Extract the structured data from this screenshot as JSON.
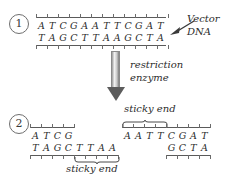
{
  "diagram": {
    "background_color": "#ffffff",
    "ink_color": "#2b2b2b"
  },
  "steps": [
    {
      "number": "1"
    },
    {
      "number": "2"
    }
  ],
  "labels": {
    "vector_dna_line1": "Vector",
    "vector_dna_line2": "DNA",
    "restriction_line1": "restriction",
    "restriction_line2": "enzyme",
    "sticky_end_right": "sticky end",
    "sticky_end_left": "sticky end"
  },
  "step1": {
    "top_strand": [
      "A",
      "T",
      "C",
      "G",
      "A",
      "A",
      "T",
      "T",
      "C",
      "G",
      "A",
      "T"
    ],
    "bottom_strand": [
      "T",
      "A",
      "G",
      "C",
      "T",
      "T",
      "A",
      "A",
      "G",
      "C",
      "T",
      "A"
    ],
    "length": 12
  },
  "step2": {
    "left_fragment": {
      "top_strand": [
        "A",
        "T",
        "C",
        "G"
      ],
      "bottom_strand": [
        "T",
        "A",
        "G",
        "C",
        "T",
        "T",
        "A",
        "A"
      ],
      "overhang": [
        "T",
        "T",
        "A",
        "A"
      ],
      "overhang_label": "sticky end"
    },
    "right_fragment": {
      "top_strand": [
        "A",
        "A",
        "T",
        "T",
        "C",
        "G",
        "A",
        "T"
      ],
      "bottom_strand": [
        "G",
        "C",
        "T",
        "A"
      ],
      "overhang": [
        "A",
        "A",
        "T",
        "T"
      ],
      "overhang_label": "sticky end"
    }
  }
}
